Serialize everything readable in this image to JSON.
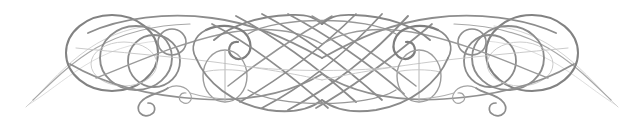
{
  "document": {
    "type": "decorative-ornament",
    "title": "Calligraphic Flourish Divider",
    "description": "Symmetric pen-drawn calligraphic ornament rule with interlaced loops, spiral curls and a central diagonal lattice",
    "alt_text": "Ornamental calligraphic divider"
  },
  "canvas": {
    "width": 644,
    "height": 125,
    "background_color": "#ffffff",
    "center_x": 322,
    "center_y": 62
  },
  "style": {
    "stroke_color_dark": "#7e7e7e",
    "stroke_color_mid": "#919191",
    "stroke_color_light": "#aaaaaa",
    "stroke_color_faint": "#c2c2c2",
    "stroke_width_heavy": 2.1,
    "stroke_width_medium": 1.5,
    "stroke_width_light": 1.0,
    "stroke_width_hair": 0.7,
    "fill": "none",
    "linecap": "round",
    "symmetry": "horizontal-mirror"
  },
  "ornament": {
    "name": "flourish-rule",
    "motifs": [
      {
        "name": "left-tail",
        "label": "tapering hairline tail",
        "position": [
          26,
          106
        ]
      },
      {
        "name": "left-outer-loop",
        "label": "large outer circle loop",
        "center": [
          110,
          52
        ],
        "radius": 45
      },
      {
        "name": "left-mid-loop",
        "label": "nested medium circle loop",
        "center": [
          133,
          58
        ],
        "radius": 34
      },
      {
        "name": "left-inner-loop",
        "label": "nested small circle loop",
        "center": [
          150,
          60
        ],
        "radius": 24
      },
      {
        "name": "left-small-ring",
        "label": "small ring",
        "center": [
          169,
          42
        ],
        "radius": 13
      },
      {
        "name": "left-lower-curl",
        "label": "lower spiral curl",
        "center": [
          146,
          98
        ]
      },
      {
        "name": "left-upper-hook",
        "label": "upper spiral hook",
        "center": [
          231,
          44
        ]
      },
      {
        "name": "left-teardrop",
        "label": "vertical oval with stem",
        "center": [
          224,
          74
        ]
      },
      {
        "name": "center-lattice",
        "label": "diagonal crosshatch lattice",
        "center": [
          322,
          62
        ],
        "span": [
          248,
          396
        ]
      },
      {
        "name": "right-teardrop",
        "label": "vertical oval with stem",
        "center": [
          420,
          74
        ]
      },
      {
        "name": "right-upper-hook",
        "label": "upper spiral hook",
        "center": [
          413,
          44
        ]
      },
      {
        "name": "right-lower-curl",
        "label": "lower spiral curl",
        "center": [
          498,
          98
        ]
      },
      {
        "name": "right-small-ring",
        "label": "small ring",
        "center": [
          475,
          42
        ],
        "radius": 13
      },
      {
        "name": "right-inner-loop",
        "label": "nested small circle loop",
        "center": [
          494,
          60
        ],
        "radius": 24
      },
      {
        "name": "right-mid-loop",
        "label": "nested medium circle loop",
        "center": [
          511,
          58
        ],
        "radius": 34
      },
      {
        "name": "right-outer-loop",
        "label": "large outer circle loop",
        "center": [
          534,
          52
        ],
        "radius": 45
      },
      {
        "name": "right-tail",
        "label": "tapering hairline tail",
        "position": [
          618,
          106
        ]
      }
    ]
  }
}
